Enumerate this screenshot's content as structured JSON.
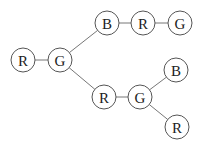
{
  "diagram": {
    "type": "tree",
    "node_radius": 12,
    "nodes": [
      {
        "id": "n1",
        "label": "R",
        "x": 23,
        "y": 60
      },
      {
        "id": "n2",
        "label": "G",
        "x": 60,
        "y": 60
      },
      {
        "id": "n3",
        "label": "B",
        "x": 107,
        "y": 23
      },
      {
        "id": "n4",
        "label": "R",
        "x": 143,
        "y": 23
      },
      {
        "id": "n5",
        "label": "G",
        "x": 180,
        "y": 23
      },
      {
        "id": "n6",
        "label": "R",
        "x": 104,
        "y": 97
      },
      {
        "id": "n7",
        "label": "G",
        "x": 140,
        "y": 97
      },
      {
        "id": "n8",
        "label": "B",
        "x": 176,
        "y": 70
      },
      {
        "id": "n9",
        "label": "R",
        "x": 177,
        "y": 127
      }
    ],
    "edges": [
      [
        "n1",
        "n2"
      ],
      [
        "n2",
        "n3"
      ],
      [
        "n3",
        "n4"
      ],
      [
        "n4",
        "n5"
      ],
      [
        "n2",
        "n6"
      ],
      [
        "n6",
        "n7"
      ],
      [
        "n7",
        "n8"
      ],
      [
        "n7",
        "n9"
      ]
    ]
  }
}
